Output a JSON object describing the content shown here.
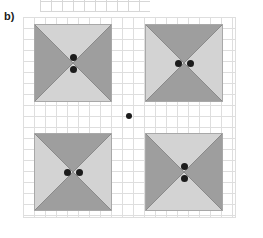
{
  "figure": {
    "width": 263,
    "height": 238,
    "background": "#ffffff",
    "panel_label": "b)",
    "grid": {
      "x": 23,
      "y": 17,
      "width": 213,
      "height": 201,
      "cell_size": 11,
      "line_color": "#dedede",
      "visible": true
    },
    "top_partial_panel": {
      "x": 40,
      "y": -10,
      "width": 110,
      "height": 22,
      "description": "cut-off grid strip from panel above",
      "line_color": "#d7d7d7"
    }
  },
  "colors": {
    "dark_triangle": "#9e9e9e",
    "light_triangle": "#d3d3d3",
    "outline": "#8a8a8a",
    "dot": "#1c1c1c",
    "grid_line": "#dedede",
    "label_text": "#1a1a1a",
    "background": "#ffffff"
  },
  "shapes": [
    {
      "name": "top-left-bowtie",
      "x": 34,
      "y": 24,
      "size": 78,
      "orientation": "horizontal",
      "dark_triangles": [
        "left",
        "right"
      ],
      "light_triangles": [
        "top",
        "bottom"
      ],
      "dots": [
        {
          "cx": 39,
          "cy": 33,
          "size": "big"
        },
        {
          "cx": 39,
          "cy": 45,
          "size": "big"
        }
      ]
    },
    {
      "name": "top-right-hourglass",
      "x": 145,
      "y": 24,
      "size": 78,
      "orientation": "vertical",
      "dark_triangles": [
        "top",
        "bottom"
      ],
      "light_triangles": [
        "left",
        "right"
      ],
      "dots": [
        {
          "cx": 33,
          "cy": 39,
          "size": "big"
        },
        {
          "cx": 45,
          "cy": 39,
          "size": "big"
        }
      ]
    },
    {
      "name": "bottom-left-hourglass",
      "x": 34,
      "y": 133,
      "size": 78,
      "orientation": "vertical",
      "dark_triangles": [
        "top",
        "bottom"
      ],
      "light_triangles": [
        "left",
        "right"
      ],
      "dots": [
        {
          "cx": 33,
          "cy": 39,
          "size": "big"
        },
        {
          "cx": 45,
          "cy": 39,
          "size": "big"
        }
      ]
    },
    {
      "name": "bottom-right-bowtie",
      "x": 145,
      "y": 133,
      "size": 78,
      "orientation": "horizontal",
      "dark_triangles": [
        "left",
        "right"
      ],
      "light_triangles": [
        "top",
        "bottom"
      ],
      "dots": [
        {
          "cx": 39,
          "cy": 33,
          "size": "big"
        },
        {
          "cx": 39,
          "cy": 45,
          "size": "big"
        }
      ]
    }
  ],
  "center_dot": {
    "name": "center-fixation-dot",
    "cx": 129,
    "cy": 116,
    "size": "small"
  }
}
